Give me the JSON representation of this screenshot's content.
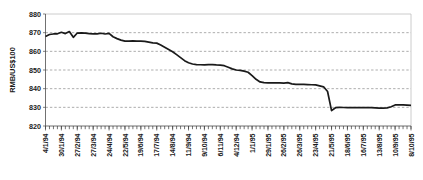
{
  "chart_data": {
    "type": "line",
    "title": "",
    "subtitle": "",
    "xlabel": "",
    "ylabel": "RMB/US$100",
    "ylim": [
      820,
      880
    ],
    "ytick_labels": [
      "880",
      "870",
      "860",
      "850",
      "840",
      "830",
      "820"
    ],
    "ytick_values": [
      880,
      870,
      860,
      850,
      840,
      830,
      820
    ],
    "grid": {
      "horizontal": true,
      "vertical": false,
      "style": "dashed"
    },
    "legend": {
      "visible": false,
      "position": "none"
    },
    "minor_ticks": {
      "axis": "x",
      "interval": "weekly",
      "count": 95
    },
    "series": [
      {
        "name": "RMB/US$100",
        "color": "#1a1a1a",
        "x": [
          "4/1/94",
          "11/1/94",
          "18/1/94",
          "25/1/94",
          "30/1/94",
          "6/2/94",
          "13/2/94",
          "20/2/94",
          "27/2/94",
          "6/3/94",
          "13/3/94",
          "20/3/94",
          "27/3/94",
          "3/4/94",
          "10/4/94",
          "17/4/94",
          "24/4/94",
          "1/5/94",
          "8/5/94",
          "15/5/94",
          "22/5/94",
          "29/5/94",
          "5/6/94",
          "12/6/94",
          "19/6/94",
          "26/6/94",
          "3/7/94",
          "10/7/94",
          "17/7/94",
          "24/7/94",
          "31/7/94",
          "7/8/94",
          "14/8/94",
          "21/8/94",
          "28/8/94",
          "4/9/94",
          "11/9/94",
          "18/9/94",
          "25/9/94",
          "2/10/94",
          "9/10/94",
          "16/10/94",
          "23/10/94",
          "30/10/94",
          "6/11/94",
          "13/11/94",
          "20/11/94",
          "27/11/94",
          "4/12/94",
          "11/12/94",
          "18/12/94",
          "25/12/94",
          "1/1/95",
          "8/1/95",
          "15/1/95",
          "22/1/95",
          "29/1/95",
          "5/2/95",
          "12/2/95",
          "19/2/95",
          "26/2/95",
          "5/3/95",
          "12/3/95",
          "19/3/95",
          "26/3/95",
          "2/4/95",
          "9/4/95",
          "16/4/95",
          "23/4/95",
          "30/4/95",
          "7/5/95",
          "14/5/95",
          "21/5/95",
          "28/5/95",
          "4/6/95",
          "11/6/95",
          "18/6/95",
          "25/6/95",
          "2/7/95",
          "9/7/95",
          "16/7/95",
          "23/7/95",
          "30/7/95",
          "6/8/95",
          "13/8/95",
          "20/8/95",
          "27/8/95",
          "3/9/95",
          "10/9/95",
          "17/9/95",
          "24/9/95",
          "1/10/95",
          "8/10/95"
        ],
        "values": [
          868.0,
          869.0,
          869.3,
          869.4,
          870.2,
          869.5,
          870.6,
          867.5,
          869.8,
          869.9,
          869.8,
          869.5,
          869.4,
          869.4,
          869.7,
          869.3,
          869.6,
          867.8,
          866.8,
          866.0,
          865.5,
          865.5,
          865.6,
          865.5,
          865.5,
          865.3,
          864.9,
          864.5,
          864.4,
          863.4,
          862.2,
          861.0,
          859.8,
          858.2,
          856.6,
          855.0,
          853.9,
          853.2,
          852.9,
          852.8,
          852.7,
          852.9,
          852.9,
          852.7,
          852.6,
          852.3,
          851.5,
          850.6,
          850.0,
          849.8,
          849.4,
          848.8,
          847.0,
          845.0,
          843.6,
          843.2,
          843.1,
          843.1,
          843.1,
          843.1,
          843.0,
          843.2,
          842.6,
          842.3,
          842.3,
          842.3,
          842.2,
          842.1,
          842.0,
          841.5,
          841.0,
          838.5,
          828.2,
          829.8,
          830.0,
          829.9,
          829.8,
          829.8,
          829.8,
          829.8,
          829.8,
          829.8,
          829.8,
          829.7,
          829.6,
          829.6,
          829.7,
          830.3,
          831.3,
          831.3,
          831.3,
          831.2,
          831.0
        ]
      }
    ],
    "xtick_labels": [
      "4/1/94",
      "30/1/94",
      "27/2/94",
      "27/3/94",
      "24/4/94",
      "22/5/94",
      "19/6/94",
      "17/7/94",
      "14/8/94",
      "11/9/94",
      "9/10/94",
      "6/11/94",
      "4/12/94",
      "1/1/95",
      "29/1/95",
      "26/2/95",
      "26/3/95",
      "23/4/95",
      "21/5/95",
      "18/6/95",
      "16/7/95",
      "13/8/95",
      "10/9/95",
      "8/10/95"
    ],
    "annotations": [],
    "colors": {
      "line": "#1a1a1a",
      "grid": "#8a8a8a",
      "axis": "#4d4d4d",
      "frame": "#bfbfbf",
      "text": "#1a1a1a",
      "background": "#ffffff"
    }
  }
}
